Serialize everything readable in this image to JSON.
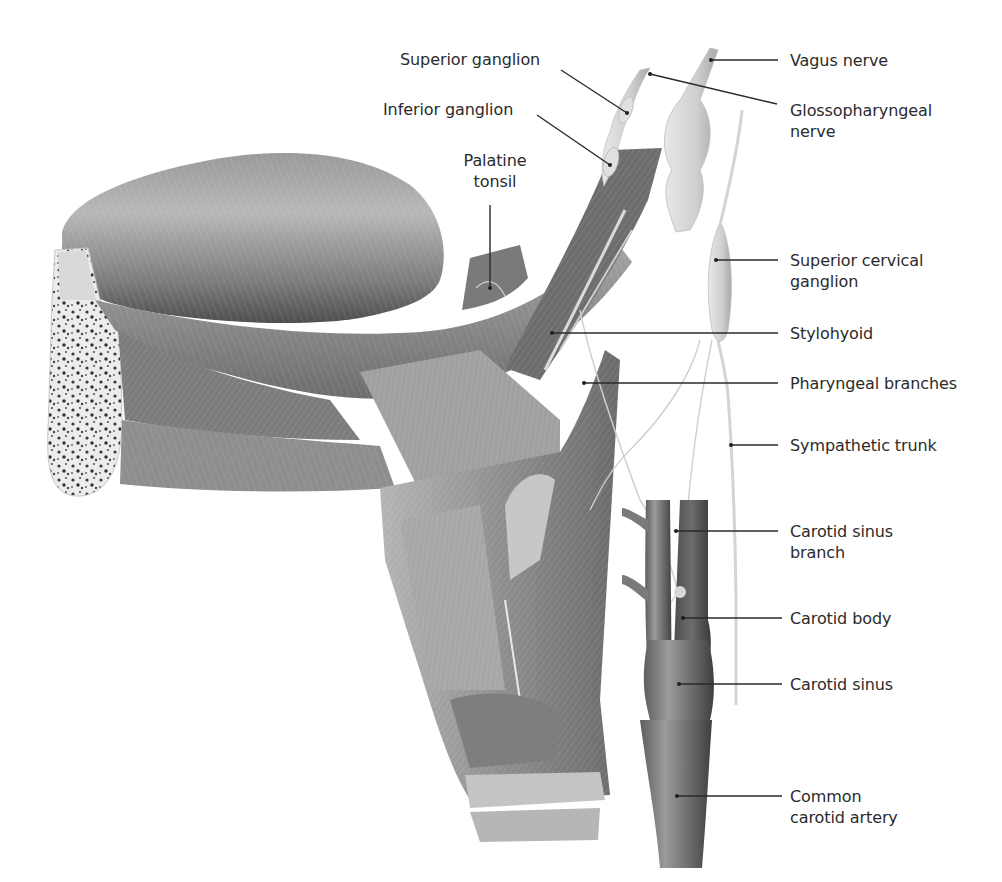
{
  "figure": {
    "colors": {
      "background": "#ffffff",
      "label_text": "#2b2b2b",
      "leader_line": "#2a2a2a",
      "muscle_dark": "#5a5a5a",
      "muscle_mid": "#8c8c8c",
      "muscle_light": "#c8c8c8",
      "nerve": "#d9d9d9",
      "artery": "#6e6e6e"
    },
    "labels": {
      "superior_ganglion": "Superior ganglion",
      "inferior_ganglion": "Inferior ganglion",
      "palatine_tonsil": "Palatine\ntonsil",
      "vagus_nerve": "Vagus nerve",
      "glossopharyngeal_nerve": "Glossopharyngeal\nnerve",
      "superior_cervical_ganglion": "Superior cervical\nganglion",
      "stylohyoid": "Stylohyoid",
      "pharyngeal_branches": "Pharyngeal branches",
      "sympathetic_trunk": "Sympathetic trunk",
      "carotid_sinus_branch": "Carotid sinus\nbranch",
      "carotid_body": "Carotid body",
      "carotid_sinus": "Carotid sinus",
      "common_carotid_artery": "Common\ncarotid artery"
    }
  }
}
